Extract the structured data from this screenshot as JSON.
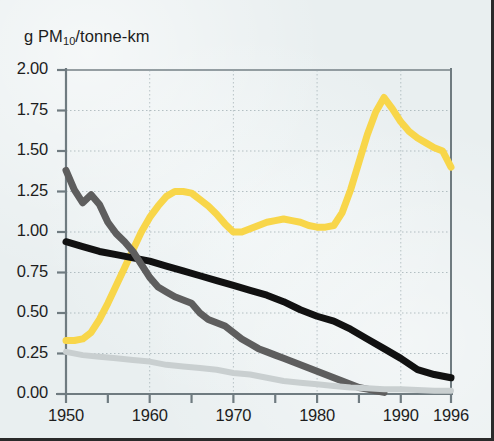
{
  "chart_data": {
    "type": "line",
    "title": "",
    "subtitle": "",
    "ylabel": "g PM10/tonne-km",
    "ylabel_parts": {
      "prefix": "g PM",
      "sub": "10",
      "suffix": "/tonne-km"
    },
    "xlabel": "",
    "xlim": [
      1950,
      1996
    ],
    "ylim": [
      0.0,
      2.0
    ],
    "grid": true,
    "grid_style": "dotted",
    "legend": "none",
    "x_ticks_major": [
      1950,
      1960,
      1970,
      1980,
      1990,
      1996
    ],
    "x_tick_labels": [
      "1950",
      "1960",
      "1970",
      "1980",
      "1990",
      "1996"
    ],
    "x_ticks_minor": [
      1955,
      1965,
      1975,
      1985
    ],
    "y_ticks": [
      0.0,
      0.25,
      0.5,
      0.75,
      1.0,
      1.25,
      1.5,
      1.75,
      2.0
    ],
    "y_tick_labels": [
      "0.00",
      "0.25",
      "0.50",
      "0.75",
      "1.00",
      "1.25",
      "1.50",
      "1.75",
      "2.00"
    ],
    "series": [
      {
        "name": "yellow-series",
        "color": "#f8d64a",
        "width": 7,
        "x": [
          1950,
          1951,
          1952,
          1953,
          1954,
          1955,
          1956,
          1957,
          1958,
          1959,
          1960,
          1961,
          1962,
          1963,
          1964,
          1965,
          1966,
          1967,
          1968,
          1969,
          1970,
          1971,
          1972,
          1973,
          1974,
          1975,
          1976,
          1977,
          1978,
          1979,
          1980,
          1981,
          1982,
          1983,
          1984,
          1985,
          1986,
          1987,
          1988,
          1989,
          1990,
          1991,
          1992,
          1993,
          1994,
          1995,
          1996
        ],
        "values": [
          0.33,
          0.33,
          0.34,
          0.38,
          0.46,
          0.56,
          0.67,
          0.78,
          0.89,
          1.0,
          1.09,
          1.16,
          1.22,
          1.25,
          1.25,
          1.24,
          1.2,
          1.16,
          1.11,
          1.05,
          1.0,
          1.0,
          1.02,
          1.04,
          1.06,
          1.07,
          1.08,
          1.07,
          1.06,
          1.04,
          1.03,
          1.03,
          1.04,
          1.12,
          1.26,
          1.43,
          1.6,
          1.74,
          1.83,
          1.76,
          1.68,
          1.62,
          1.58,
          1.55,
          1.52,
          1.5,
          1.4
        ]
      },
      {
        "name": "black-series",
        "color": "#111111",
        "width": 7,
        "x": [
          1950,
          1952,
          1954,
          1956,
          1958,
          1960,
          1962,
          1964,
          1966,
          1968,
          1970,
          1972,
          1974,
          1976,
          1978,
          1980,
          1982,
          1984,
          1986,
          1988,
          1990,
          1992,
          1994,
          1996
        ],
        "values": [
          0.94,
          0.91,
          0.88,
          0.86,
          0.84,
          0.82,
          0.79,
          0.76,
          0.73,
          0.7,
          0.67,
          0.64,
          0.61,
          0.57,
          0.52,
          0.48,
          0.45,
          0.4,
          0.34,
          0.28,
          0.22,
          0.15,
          0.12,
          0.1
        ]
      },
      {
        "name": "dark-gray-series",
        "color": "#5e5e5e",
        "width": 7,
        "x": [
          1950,
          1951,
          1952,
          1953,
          1954,
          1955,
          1956,
          1957,
          1958,
          1959,
          1960,
          1961,
          1962,
          1963,
          1964,
          1965,
          1966,
          1967,
          1968,
          1969,
          1970,
          1971,
          1972,
          1973,
          1974,
          1975,
          1976,
          1977,
          1978,
          1979,
          1980,
          1981,
          1982,
          1983,
          1984,
          1985,
          1986,
          1987,
          1988
        ],
        "values": [
          1.38,
          1.26,
          1.18,
          1.23,
          1.17,
          1.06,
          0.99,
          0.94,
          0.88,
          0.8,
          0.72,
          0.66,
          0.63,
          0.6,
          0.58,
          0.56,
          0.5,
          0.46,
          0.44,
          0.42,
          0.38,
          0.34,
          0.31,
          0.28,
          0.26,
          0.24,
          0.22,
          0.2,
          0.18,
          0.16,
          0.14,
          0.12,
          0.1,
          0.08,
          0.06,
          0.04,
          0.03,
          0.02,
          0.01
        ]
      },
      {
        "name": "light-gray-series",
        "color": "#c9cfd0",
        "width": 6,
        "x": [
          1950,
          1952,
          1954,
          1956,
          1958,
          1960,
          1962,
          1964,
          1966,
          1968,
          1970,
          1972,
          1974,
          1976,
          1978,
          1980,
          1982,
          1984,
          1986,
          1988,
          1990,
          1992,
          1994,
          1996
        ],
        "values": [
          0.26,
          0.24,
          0.23,
          0.22,
          0.21,
          0.2,
          0.18,
          0.17,
          0.16,
          0.15,
          0.13,
          0.12,
          0.1,
          0.08,
          0.07,
          0.06,
          0.05,
          0.04,
          0.035,
          0.03,
          0.03,
          0.025,
          0.02,
          0.02
        ]
      }
    ]
  },
  "axes": {
    "background_color": "#e9eff0",
    "axis_color": "#6f7b80",
    "grid_color": "#93a3a8",
    "text_color": "#1d1d1d",
    "border_color": "#2a2a2a"
  }
}
